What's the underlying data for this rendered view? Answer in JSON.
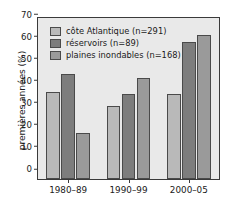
{
  "chart_data": {
    "type": "bar",
    "title": "",
    "xlabel": "",
    "ylabel": "premières années (%)",
    "categories": [
      "1980–89",
      "1990–99",
      "2000–05"
    ],
    "ylim": [
      0,
      73
    ],
    "yticks": [
      0,
      10,
      20,
      30,
      40,
      50,
      60,
      70
    ],
    "ytick_labels": [
      "0",
      "10",
      "20",
      "30",
      "40",
      "50",
      "60",
      "70"
    ],
    "grid": false,
    "legend_position": "top-left",
    "series": [
      {
        "name": "côte Atlantique (n=291)",
        "color": "#b9b9b9",
        "values": [
          39.5,
          33.0,
          38.5
        ]
      },
      {
        "name": "réservoirs (n=89)",
        "color": "#7d7d7d",
        "values": [
          47.5,
          38.5,
          62.0
        ]
      },
      {
        "name": "plaines inondables (n=168)",
        "color": "#9a9a9a",
        "values": [
          21.0,
          46.0,
          65.5
        ]
      }
    ]
  },
  "legend": {
    "items": [
      {
        "label": "côte Atlantique (n=291)"
      },
      {
        "label": "réservoirs (n=89)"
      },
      {
        "label": "plaines inondables (n=168)"
      }
    ]
  },
  "axes": {
    "y_title": "premières années (%)"
  }
}
